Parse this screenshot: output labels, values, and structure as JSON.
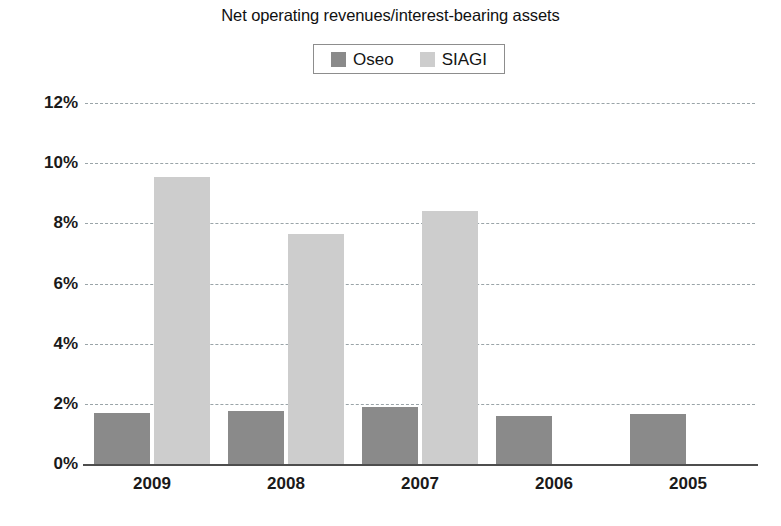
{
  "chart_data": {
    "type": "bar",
    "title": "Net operating revenues/interest-bearing assets",
    "xlabel": "",
    "ylabel": "",
    "categories": [
      "2009",
      "2008",
      "2007",
      "2006",
      "2005"
    ],
    "series": [
      {
        "name": "Oseo",
        "color": "#8a8a8a",
        "values": [
          1.7,
          1.75,
          1.9,
          1.6,
          1.65
        ]
      },
      {
        "name": "SIAGI",
        "color": "#cdcdcd",
        "values": [
          9.55,
          7.65,
          8.4,
          null,
          null
        ]
      }
    ],
    "ylim": [
      0,
      12
    ],
    "ytick_values": [
      0,
      2,
      4,
      6,
      8,
      10,
      12
    ],
    "ytick_labels": [
      "0%",
      "2%",
      "4%",
      "6%",
      "8%",
      "10%",
      "12%"
    ],
    "grid": true,
    "grid_style": "dashed",
    "grid_color": "#9aa4a8",
    "legend_position": "top-center",
    "legend_entries": [
      "Oseo",
      "SIAGI"
    ],
    "value_format": "percent",
    "background": "#ffffff"
  }
}
